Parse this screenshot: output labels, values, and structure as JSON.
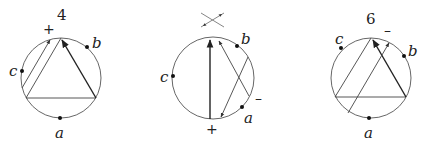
{
  "diagrams": [
    {
      "id": "left",
      "top_label": "4",
      "sign": "+",
      "points": {
        "a": "a",
        "b": "b",
        "c": "c"
      }
    },
    {
      "id": "middle",
      "top_icon": "crossing-icon",
      "sign_bottom": "+",
      "sign_right": "–",
      "points": {
        "a": "a",
        "b": "b",
        "c": "c"
      }
    },
    {
      "id": "right",
      "top_label": "6",
      "sign": "–",
      "points": {
        "a": "a",
        "b": "b",
        "c": "c"
      }
    }
  ]
}
